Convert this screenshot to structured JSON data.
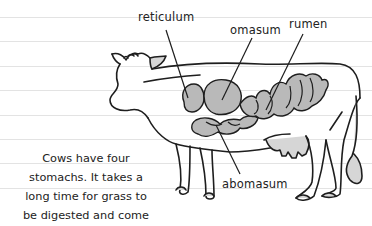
{
  "diagram": {
    "labels": {
      "reticulum": "reticulum",
      "omasum": "omasum",
      "rumen": "rumen",
      "abomasum": "abomasum"
    },
    "caption_lines": [
      "Cows have four",
      "stomachs. It takes a",
      "long time for grass to",
      "be digested and come",
      "out the other end."
    ],
    "colors": {
      "paper": "#ffffff",
      "rule_line": "#e3e3e3",
      "outline": "#1e1e1e",
      "stomach_fill": "#b9b9b9",
      "shade_fill": "#d6d6d6"
    }
  }
}
